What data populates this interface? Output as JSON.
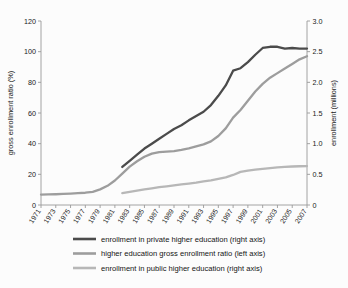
{
  "chart_data": {
    "type": "line",
    "title": "",
    "xlabel": "",
    "ylabel": "gross enrollment ratio (%)",
    "y2label": "enrollment (millions)",
    "grid": false,
    "legend_position": "bottom",
    "xlim": [
      1971,
      2007
    ],
    "ylim": [
      0,
      120
    ],
    "y2lim": [
      0,
      3.0
    ],
    "yticks": [
      0,
      20,
      40,
      60,
      80,
      100,
      120
    ],
    "ytick_labels": [
      "0",
      "20",
      "40",
      "60",
      "80",
      "100",
      "120"
    ],
    "y2ticks": [
      0,
      0.5,
      1.0,
      1.5,
      2.0,
      2.5,
      3.0
    ],
    "y2tick_labels": [
      "0",
      "0.5",
      "1.0",
      "1.5",
      "2.0",
      "2.5",
      "3.0"
    ],
    "x": [
      1971,
      1972,
      1973,
      1974,
      1975,
      1976,
      1977,
      1978,
      1979,
      1980,
      1981,
      1982,
      1983,
      1984,
      1985,
      1986,
      1987,
      1988,
      1989,
      1990,
      1991,
      1992,
      1993,
      1994,
      1995,
      1996,
      1997,
      1998,
      1999,
      2000,
      2001,
      2002,
      2003,
      2004,
      2005,
      2006,
      2007
    ],
    "xtick_labels": [
      "1971",
      "1973",
      "1975",
      "1977",
      "1979",
      "1981",
      "1983",
      "1985",
      "1987",
      "1989",
      "1991",
      "1993",
      "1995",
      "1997",
      "1999",
      "2001",
      "2003",
      "2005",
      "2007"
    ],
    "series": [
      {
        "name": "enrollment in private higher education (right axis)",
        "axis": "right",
        "color": "#4b4b4b",
        "width": 2.3,
        "start_year": 1982,
        "values": [
          null,
          null,
          null,
          null,
          null,
          null,
          null,
          null,
          null,
          null,
          null,
          0.62,
          0.72,
          0.82,
          0.92,
          1.0,
          1.08,
          1.16,
          1.24,
          1.3,
          1.38,
          1.45,
          1.52,
          1.63,
          1.78,
          1.95,
          2.19,
          2.23,
          2.33,
          2.45,
          2.56,
          2.58,
          2.58,
          2.55,
          2.56,
          2.55,
          2.55
        ]
      },
      {
        "name": "higher education gross enrollment ratio (left axis)",
        "axis": "left",
        "color": "#9d9d9d",
        "width": 2.3,
        "start_year": 1971,
        "values": [
          6.8,
          6.9,
          7.0,
          7.2,
          7.4,
          7.7,
          8.0,
          8.6,
          10.2,
          12.5,
          16.0,
          20.5,
          25.0,
          28.5,
          31.5,
          33.5,
          34.5,
          34.8,
          35.2,
          36.0,
          37.0,
          38.2,
          39.5,
          41.5,
          45.0,
          50.0,
          57.0,
          62.0,
          68.0,
          74.0,
          79.0,
          83.0,
          86.0,
          89.0,
          92.0,
          95.0,
          97.0
        ]
      },
      {
        "name": "enrollment in public higher education (right axis)",
        "axis": "right",
        "color": "#b7b7b7",
        "width": 2.3,
        "start_year": 1982,
        "values": [
          null,
          null,
          null,
          null,
          null,
          null,
          null,
          null,
          null,
          null,
          null,
          0.195,
          0.215,
          0.235,
          0.255,
          0.272,
          0.29,
          0.305,
          0.32,
          0.335,
          0.35,
          0.365,
          0.385,
          0.4,
          0.425,
          0.45,
          0.49,
          0.54,
          0.56,
          0.575,
          0.59,
          0.6,
          0.612,
          0.62,
          0.628,
          0.632,
          0.635
        ]
      }
    ],
    "legend": [
      {
        "label": "enrollment in private higher education (right axis)",
        "color": "#4b4b4b"
      },
      {
        "label": "higher education gross enrollment ratio (left axis)",
        "color": "#9d9d9d"
      },
      {
        "label": "enrollment in public higher education (right axis)",
        "color": "#b7b7b7"
      }
    ]
  }
}
